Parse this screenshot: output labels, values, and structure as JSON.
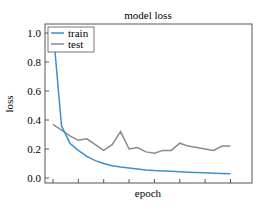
{
  "chart_data": {
    "type": "line",
    "title": "model loss",
    "xlabel": "epoch",
    "ylabel": "loss",
    "ylim": [
      0.0,
      1.0
    ],
    "yticks": [
      "0.0",
      "0.2",
      "0.4",
      "0.6",
      "0.8",
      "1.0"
    ],
    "xticks_count": 8,
    "xtick_labels_visible": false,
    "grid": false,
    "legend_position": "upper left",
    "x": [
      0,
      1,
      2,
      3,
      4,
      5,
      6,
      7,
      8,
      9,
      10,
      11,
      12,
      13,
      14,
      15,
      16,
      17,
      18,
      19,
      20,
      21
    ],
    "series": [
      {
        "name": "train",
        "color": "#3a8fd0",
        "values": [
          1.03,
          0.36,
          0.24,
          0.19,
          0.15,
          0.12,
          0.1,
          0.085,
          0.075,
          0.068,
          0.062,
          0.056,
          0.052,
          0.049,
          0.046,
          0.043,
          0.04,
          0.038,
          0.036,
          0.033,
          0.031,
          0.029
        ]
      },
      {
        "name": "test",
        "color": "#8a8a8a",
        "values": [
          0.37,
          0.33,
          0.29,
          0.26,
          0.27,
          0.23,
          0.19,
          0.23,
          0.32,
          0.2,
          0.21,
          0.18,
          0.17,
          0.19,
          0.19,
          0.24,
          0.22,
          0.21,
          0.2,
          0.19,
          0.22,
          0.22
        ]
      }
    ]
  },
  "labels": {
    "title": "model loss",
    "xlabel": "epoch",
    "ylabel": "loss",
    "legend_train": "train",
    "legend_test": "test",
    "yticks": [
      "0.0",
      "0.2",
      "0.4",
      "0.6",
      "0.8",
      "1.0"
    ]
  }
}
